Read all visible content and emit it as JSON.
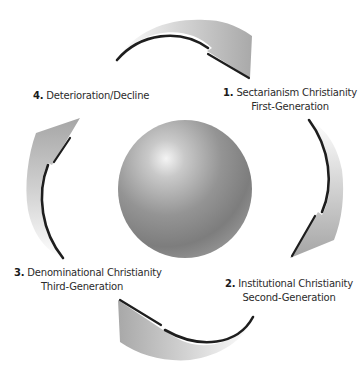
{
  "diagram": {
    "title": "",
    "stages": [
      {
        "number": "1.",
        "name": "Sectarianism Christianity",
        "generation": "First-Generation"
      },
      {
        "number": "2.",
        "name": "Institutional Christianity",
        "generation": "Second-Generation"
      },
      {
        "number": "3.",
        "name": "Denominational Christianity",
        "generation": "Third-Generation"
      },
      {
        "number": "4.",
        "name": "Deterioration/Decline",
        "generation": ""
      }
    ],
    "center": {
      "shape": "sphere",
      "color": "#8c8c8c"
    },
    "arrows": {
      "count": 4,
      "direction": "clockwise",
      "color": "#bdbdbd",
      "edge_color": "#1e1e1e"
    }
  }
}
